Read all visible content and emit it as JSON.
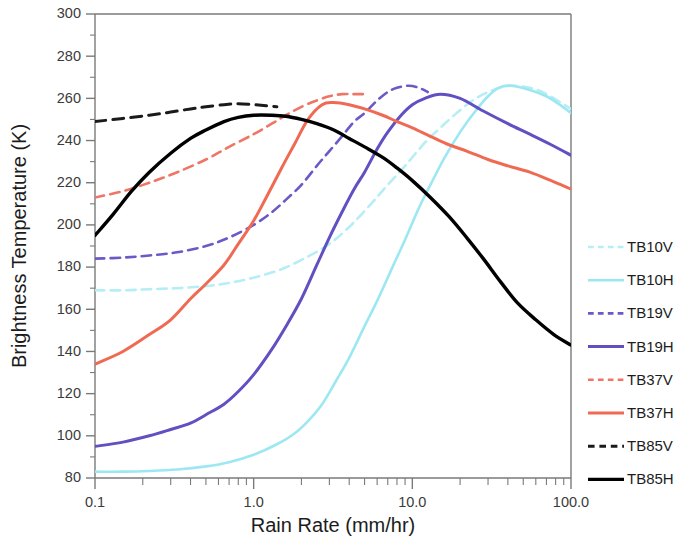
{
  "chart_data": {
    "type": "line",
    "title": "",
    "xlabel": "Rain Rate (mm/hr)",
    "ylabel": "Brightness Temperature (K)",
    "xscale": "log",
    "xlim": [
      0.1,
      100.0
    ],
    "ylim": [
      80,
      300
    ],
    "xticks": [
      "0.1",
      "1.0",
      "10.0",
      "100.0"
    ],
    "xtick_values": [
      0.1,
      1.0,
      10.0,
      100.0
    ],
    "yticks": [
      "80",
      "100",
      "120",
      "140",
      "160",
      "180",
      "200",
      "220",
      "240",
      "260",
      "280",
      "300"
    ],
    "ytick_values": [
      80,
      100,
      120,
      140,
      160,
      180,
      200,
      220,
      240,
      260,
      280,
      300
    ],
    "yminor_step": 10,
    "grid": false,
    "legend_position": "right",
    "series": [
      {
        "name": "TB10V",
        "color": "#b5eef5",
        "style": "dashed",
        "width": 2.6,
        "x": [
          0.1,
          0.15,
          0.22,
          0.33,
          0.5,
          0.7,
          1.0,
          1.5,
          2.2,
          3.0,
          4.0,
          5.5,
          7.0,
          9.0,
          12.0,
          15.0,
          19.0,
          24.0,
          30.0,
          40.0,
          55.0,
          70.0,
          100.0
        ],
        "y": [
          169,
          169,
          169.5,
          170,
          171,
          172.5,
          175,
          179,
          185,
          191,
          199,
          210,
          219,
          228,
          239,
          246,
          253,
          259,
          263,
          266,
          265,
          262,
          255
        ]
      },
      {
        "name": "TB10H",
        "color": "#9ce8f2",
        "style": "solid",
        "width": 2.6,
        "x": [
          0.1,
          0.15,
          0.22,
          0.33,
          0.5,
          0.7,
          1.0,
          1.4,
          1.8,
          2.2,
          2.7,
          3.3,
          4.0,
          5.0,
          6.0,
          7.5,
          9.0,
          11.0,
          13.0,
          16.0,
          20.0,
          25.0,
          30.0,
          35.0,
          42.0,
          55.0,
          70.0,
          85.0,
          100.0
        ],
        "y": [
          83,
          83,
          83.3,
          84,
          85.5,
          87.5,
          91,
          96,
          101,
          107,
          115,
          126,
          137,
          152,
          164,
          180,
          193,
          208,
          219,
          232,
          244,
          254,
          261,
          265,
          266,
          264,
          261,
          257,
          253
        ]
      },
      {
        "name": "TB19V",
        "color": "#6a5ac8",
        "style": "dashed",
        "width": 2.6,
        "x": [
          0.1,
          0.15,
          0.22,
          0.33,
          0.5,
          0.7,
          1.0,
          1.3,
          1.6,
          2.0,
          2.5,
          3.0,
          3.6,
          4.3,
          5.0,
          6.0,
          7.0,
          8.0,
          9.5,
          11.0,
          12.5
        ],
        "y": [
          184,
          184.5,
          185.5,
          187,
          190,
          194,
          200,
          206,
          212,
          219,
          228,
          235,
          242,
          249,
          253,
          259,
          263,
          265,
          266,
          265,
          263
        ]
      },
      {
        "name": "TB19H",
        "color": "#6050c2",
        "style": "solid",
        "width": 3.0,
        "x": [
          0.1,
          0.15,
          0.22,
          0.3,
          0.4,
          0.5,
          0.65,
          0.8,
          1.0,
          1.3,
          1.6,
          2.0,
          2.5,
          3.0,
          3.6,
          4.3,
          5.0,
          6.0,
          7.0,
          8.5,
          10.0,
          12.0,
          15.0,
          20.0,
          28.0,
          40.0,
          55.0,
          75.0,
          100.0
        ],
        "y": [
          95,
          97,
          100,
          103,
          106,
          110,
          115,
          121,
          129,
          141,
          152,
          165,
          181,
          194,
          206,
          217,
          225,
          236,
          244,
          252,
          257,
          260,
          262,
          260,
          254,
          248,
          243,
          238,
          233
        ]
      },
      {
        "name": "TB37V",
        "color": "#ef7666",
        "style": "dashed",
        "width": 2.6,
        "x": [
          0.1,
          0.15,
          0.22,
          0.33,
          0.5,
          0.7,
          1.0,
          1.3,
          1.6,
          2.0,
          2.5,
          3.0,
          3.6,
          4.3,
          5.0
        ],
        "y": [
          213,
          216,
          220,
          225,
          231,
          237,
          243,
          248,
          252,
          256,
          259,
          261,
          262,
          262,
          262
        ]
      },
      {
        "name": "TB37H",
        "color": "#f06a53",
        "style": "solid",
        "width": 3.0,
        "x": [
          0.1,
          0.15,
          0.22,
          0.3,
          0.4,
          0.5,
          0.65,
          0.8,
          1.0,
          1.2,
          1.5,
          1.8,
          2.2,
          2.7,
          3.2,
          4.0,
          5.0,
          6.5,
          8.0,
          10.0,
          13.0,
          17.0,
          22.0,
          30.0,
          40.0,
          55.0,
          75.0,
          100.0
        ],
        "y": [
          134,
          140,
          148,
          155,
          165,
          172,
          181,
          191,
          202,
          213,
          227,
          238,
          250,
          257,
          258,
          257,
          255,
          252,
          249,
          246,
          242,
          238,
          235,
          231,
          228,
          225,
          221,
          217
        ]
      },
      {
        "name": "TB85V",
        "color": "#1a1a1a",
        "style": "dashed",
        "width": 3.0,
        "x": [
          0.1,
          0.15,
          0.22,
          0.3,
          0.4,
          0.5,
          0.65,
          0.8,
          1.0,
          1.2,
          1.4
        ],
        "y": [
          249,
          250.5,
          252,
          253.5,
          255,
          256,
          257,
          257.5,
          257,
          256.5,
          256
        ]
      },
      {
        "name": "TB85H",
        "color": "#000000",
        "style": "solid",
        "width": 3.4,
        "x": [
          0.1,
          0.13,
          0.17,
          0.22,
          0.3,
          0.4,
          0.5,
          0.65,
          0.8,
          1.0,
          1.3,
          1.6,
          2.0,
          2.5,
          3.2,
          4.0,
          5.0,
          6.5,
          8.0,
          10.0,
          13.0,
          17.0,
          22.0,
          28.0,
          36.0,
          46.0,
          60.0,
          78.0,
          100.0
        ],
        "y": [
          195,
          205,
          216,
          225,
          234,
          241,
          245,
          249,
          251,
          252,
          252,
          251.5,
          250,
          248,
          245,
          241,
          237,
          232,
          227,
          221,
          213,
          204,
          194,
          184,
          173,
          163,
          155,
          148,
          143
        ]
      }
    ]
  },
  "legend": {
    "entries": [
      {
        "label": "TB10V"
      },
      {
        "label": "TB10H"
      },
      {
        "label": "TB19V"
      },
      {
        "label": "TB19H"
      },
      {
        "label": "TB37V"
      },
      {
        "label": "TB37H"
      },
      {
        "label": "TB85V"
      },
      {
        "label": "TB85H"
      }
    ]
  }
}
